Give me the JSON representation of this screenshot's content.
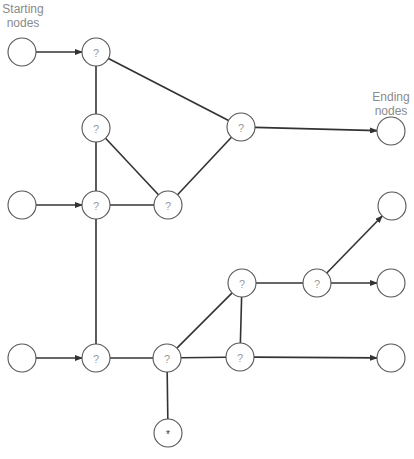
{
  "labels": {
    "start": [
      "Starting",
      "nodes"
    ],
    "end": [
      "Ending",
      "nodes"
    ]
  },
  "node_symbols": {
    "unknown": "?",
    "special": "*"
  },
  "colors": {
    "edge": "#333333",
    "node_stroke": "#555555",
    "label_text": "#8a8a8a",
    "question_text": "#9a9a9a"
  },
  "nodes": [
    {
      "id": "S1",
      "type": "start",
      "x": 22,
      "y": 52
    },
    {
      "id": "S2",
      "type": "start",
      "x": 22,
      "y": 205
    },
    {
      "id": "S3",
      "type": "start",
      "x": 22,
      "y": 358
    },
    {
      "id": "Q1",
      "type": "unknown",
      "x": 96,
      "y": 52
    },
    {
      "id": "Q2",
      "type": "unknown",
      "x": 96,
      "y": 128
    },
    {
      "id": "Q3",
      "type": "unknown",
      "x": 96,
      "y": 205
    },
    {
      "id": "Q4",
      "type": "unknown",
      "x": 168,
      "y": 205
    },
    {
      "id": "Q5",
      "type": "unknown",
      "x": 241,
      "y": 127
    },
    {
      "id": "Q6",
      "type": "unknown",
      "x": 96,
      "y": 358
    },
    {
      "id": "Q7",
      "type": "unknown",
      "x": 167,
      "y": 358
    },
    {
      "id": "Q8",
      "type": "unknown",
      "x": 242,
      "y": 283
    },
    {
      "id": "Q9",
      "type": "unknown",
      "x": 240,
      "y": 357
    },
    {
      "id": "Q10",
      "type": "unknown",
      "x": 317,
      "y": 283
    },
    {
      "id": "X1",
      "type": "special",
      "x": 168,
      "y": 433
    },
    {
      "id": "E1",
      "type": "end",
      "x": 391,
      "y": 131
    },
    {
      "id": "E2",
      "type": "end",
      "x": 392,
      "y": 206
    },
    {
      "id": "E3",
      "type": "end",
      "x": 391,
      "y": 283
    },
    {
      "id": "E4",
      "type": "end",
      "x": 391,
      "y": 358
    }
  ],
  "edges": [
    {
      "from": "S1",
      "to": "Q1",
      "arrow": true
    },
    {
      "from": "S2",
      "to": "Q3",
      "arrow": true
    },
    {
      "from": "S3",
      "to": "Q6",
      "arrow": true
    },
    {
      "from": "Q1",
      "to": "Q2",
      "arrow": false
    },
    {
      "from": "Q1",
      "to": "Q5",
      "arrow": false
    },
    {
      "from": "Q2",
      "to": "Q3",
      "arrow": false
    },
    {
      "from": "Q2",
      "to": "Q4",
      "arrow": false
    },
    {
      "from": "Q3",
      "to": "Q4",
      "arrow": false
    },
    {
      "from": "Q4",
      "to": "Q5",
      "arrow": false
    },
    {
      "from": "Q5",
      "to": "E1",
      "arrow": true
    },
    {
      "from": "Q3",
      "to": "Q6",
      "arrow": false
    },
    {
      "from": "Q6",
      "to": "Q7",
      "arrow": false
    },
    {
      "from": "Q7",
      "to": "Q8",
      "arrow": false
    },
    {
      "from": "Q7",
      "to": "Q9",
      "arrow": false
    },
    {
      "from": "Q7",
      "to": "X1",
      "arrow": false
    },
    {
      "from": "Q8",
      "to": "Q9",
      "arrow": false
    },
    {
      "from": "Q8",
      "to": "Q10",
      "arrow": false
    },
    {
      "from": "Q10",
      "to": "E2",
      "arrow": true
    },
    {
      "from": "Q10",
      "to": "E3",
      "arrow": true
    },
    {
      "from": "Q9",
      "to": "E4",
      "arrow": true
    }
  ]
}
